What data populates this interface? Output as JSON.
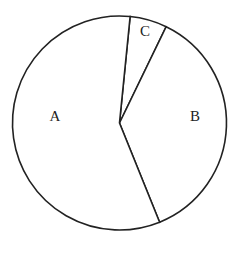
{
  "chart_data": {
    "type": "pie",
    "title": "",
    "labels": [
      "A",
      "B",
      "C"
    ],
    "values": [
      57.7,
      36.7,
      5.6
    ],
    "start_angle_deg": 5.7,
    "direction": "clockwise",
    "order_from_start": [
      "C",
      "B",
      "A"
    ],
    "legend": "none",
    "label_placement": "inside"
  },
  "geometry": {
    "cx": 119.5,
    "cy": 123,
    "r": 107,
    "label_positions": {
      "A": [
        55,
        118
      ],
      "B": [
        195,
        118
      ],
      "C": [
        145,
        33
      ]
    }
  },
  "colors": {
    "stroke": "#222222",
    "fill": "#ffffff"
  }
}
